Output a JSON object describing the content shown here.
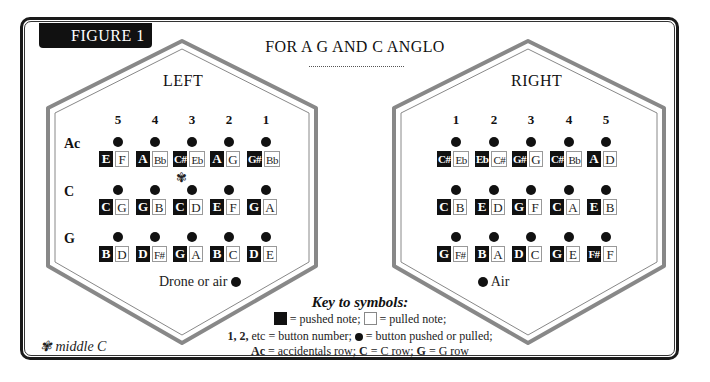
{
  "figure_label": "FIGURE 1",
  "title": "FOR A G AND C ANGLO",
  "colors": {
    "pushed": "#111111",
    "pulled": "#ffffff",
    "border": "#999999"
  },
  "left": {
    "title": "LEFT",
    "column_numbers": [
      "5",
      "4",
      "3",
      "2",
      "1"
    ],
    "rows": [
      {
        "label": "Ac",
        "buttons": [
          {
            "push": "E",
            "pull": "F"
          },
          {
            "push": "A",
            "pull": "Bb"
          },
          {
            "push": "C#",
            "pull": "Eb"
          },
          {
            "push": "A",
            "pull": "G"
          },
          {
            "push": "G#",
            "pull": "Bb"
          }
        ]
      },
      {
        "label": "C",
        "buttons": [
          {
            "push": "C",
            "pull": "G"
          },
          {
            "push": "G",
            "pull": "B"
          },
          {
            "push": "C",
            "pull": "D"
          },
          {
            "push": "E",
            "pull": "F"
          },
          {
            "push": "G",
            "pull": "A"
          }
        ]
      },
      {
        "label": "G",
        "buttons": [
          {
            "push": "B",
            "pull": "D"
          },
          {
            "push": "D",
            "pull": "F#"
          },
          {
            "push": "G",
            "pull": "A"
          },
          {
            "push": "B",
            "pull": "C"
          },
          {
            "push": "D",
            "pull": "E"
          }
        ]
      }
    ],
    "footer": "Drone or air"
  },
  "right": {
    "title": "RIGHT",
    "column_numbers": [
      "1",
      "2",
      "3",
      "4",
      "5"
    ],
    "rows": [
      {
        "label": "Ac",
        "buttons": [
          {
            "push": "C#",
            "pull": "Eb"
          },
          {
            "push": "Eb",
            "pull": "C#"
          },
          {
            "push": "G#",
            "pull": "G"
          },
          {
            "push": "C#",
            "pull": "Bb"
          },
          {
            "push": "A",
            "pull": "D"
          }
        ]
      },
      {
        "label": "C",
        "buttons": [
          {
            "push": "C",
            "pull": "B"
          },
          {
            "push": "E",
            "pull": "D"
          },
          {
            "push": "G",
            "pull": "F"
          },
          {
            "push": "C",
            "pull": "A"
          },
          {
            "push": "E",
            "pull": "B"
          }
        ]
      },
      {
        "label": "G",
        "buttons": [
          {
            "push": "G",
            "pull": "F#"
          },
          {
            "push": "B",
            "pull": "A"
          },
          {
            "push": "D",
            "pull": "C"
          },
          {
            "push": "G",
            "pull": "E"
          },
          {
            "push": "F#",
            "pull": "F"
          }
        ]
      }
    ],
    "footer": "Air"
  },
  "middle_c": {
    "symbol": "✾",
    "label": "middle C"
  },
  "key": {
    "title": "Key to symbols:",
    "pushed": "= pushed note;",
    "pulled": "= pulled note;",
    "numbers_bold": "1, 2,",
    "numbers_text": "etc = button number;",
    "dot_text": "= button pushed or pulled;",
    "ac_bold": "Ac",
    "ac_text": "= accidentals row;",
    "c_bold": "C",
    "c_text": "= C row;",
    "g_bold": "G",
    "g_text": "= G row"
  }
}
